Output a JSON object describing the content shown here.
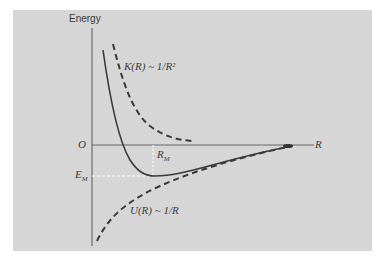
{
  "figure": {
    "y_axis_label": "Energy",
    "x_axis_label": "R",
    "origin_label": "O",
    "kinetic_label": "K(R) ~ 1/R²",
    "potential_label": "U(R) ~ 1/R",
    "min_distance_label": "R_M",
    "min_distance_main": "R",
    "min_distance_sub": "M",
    "min_energy_main": "E",
    "min_energy_sub": "M"
  },
  "colors": {
    "background": "#ffffff",
    "panel": "#d6d6d6",
    "curve": "#3a3a3a",
    "guide": "#ffffff"
  },
  "curves": [
    {
      "name": "total-energy",
      "style": "solid"
    },
    {
      "name": "kinetic-energy",
      "style": "dashed",
      "trend": "1/R^2"
    },
    {
      "name": "potential-energy",
      "style": "dashed",
      "trend": "-1/R"
    }
  ]
}
